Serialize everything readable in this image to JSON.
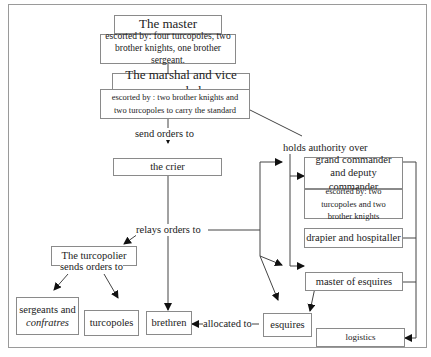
{
  "diagram": {
    "nodes": {
      "master": "The master",
      "master_escort": "escorted by: four turcopoles, two brother knights, one brother sergeant.",
      "marshal": "The marshal and vice marshal",
      "marshal_escort": "escorted by : two brother knights and two turcopoles to carry the standard",
      "crier": "the crier",
      "turcopolier": "The turcopolier",
      "sergeants_line1": "sergeants and",
      "sergeants_line2": "confratres",
      "turcopoles": "turcopoles",
      "brethren": "brethren",
      "esquires": "esquires",
      "grand_commander": "grand commander and deputy commander",
      "grand_commander_escort": "escorted by: two turcopoles and two brother knights",
      "drapier": "drapier and hospitaller",
      "master_of_esquires": "master of esquires",
      "logistics": "logistics"
    },
    "edge_labels": {
      "send_orders": "send orders to",
      "holds_authority": "holds authority over",
      "relays_orders": "relays orders to",
      "sends_orders": "sends orders to",
      "allocated": "allocated to"
    },
    "colors": {
      "line": "#333333",
      "box_border": "#8a8a8a",
      "frame": "#9a9a9a"
    }
  }
}
